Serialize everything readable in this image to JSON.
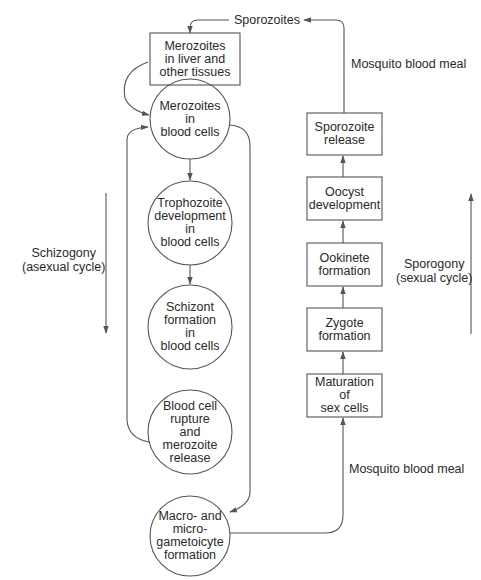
{
  "top_label": "Sporozoites",
  "mosquito_meal_top": "Mosquito blood meal",
  "mosquito_meal_bottom": "Mosquito blood meal",
  "schizogony": {
    "line1": "Schizogony",
    "line2": "(asexual cycle)"
  },
  "sporogony": {
    "line1": "Sporogony",
    "line2": "(sexual cycle)"
  },
  "left_column": [
    {
      "shape": "box",
      "lines": [
        "Merozoites",
        "in liver and",
        "other tissues"
      ]
    },
    {
      "shape": "circle",
      "lines": [
        "Merozoites",
        "in",
        "blood cells"
      ]
    },
    {
      "shape": "circle",
      "lines": [
        "Trophozoite",
        "development",
        "in",
        "blood cells"
      ]
    },
    {
      "shape": "circle",
      "lines": [
        "Schizont",
        "formation",
        "in",
        "blood cells"
      ]
    },
    {
      "shape": "circle",
      "lines": [
        "Blood cell",
        "rupture",
        "and",
        "merozoite",
        "release"
      ]
    },
    {
      "shape": "circle",
      "lines": [
        "Macro- and",
        "micro-",
        "gametoicyte",
        "formation"
      ]
    }
  ],
  "right_column": [
    {
      "shape": "box",
      "lines": [
        "Sporozoite",
        "release"
      ]
    },
    {
      "shape": "box",
      "lines": [
        "Oocyst",
        "development"
      ]
    },
    {
      "shape": "box",
      "lines": [
        "Ookinete",
        "formation"
      ]
    },
    {
      "shape": "box",
      "lines": [
        "Zygote",
        "formation"
      ]
    },
    {
      "shape": "box",
      "lines": [
        "Maturation",
        "of",
        "sex cells"
      ]
    }
  ],
  "colors": {
    "stroke": "#555555",
    "text": "#2a2a2a",
    "background": "#ffffff"
  }
}
